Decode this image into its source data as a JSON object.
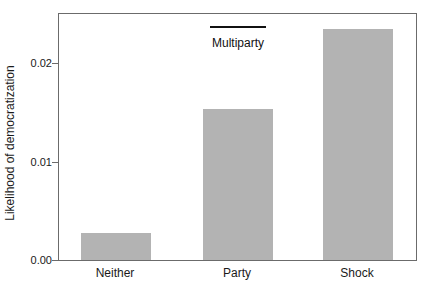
{
  "chart_data": {
    "type": "bar",
    "title": "",
    "xlabel": "",
    "ylabel": "Likelihood of democratization",
    "categories": [
      "Neither",
      "Party",
      "Shock"
    ],
    "values": [
      0.0027,
      0.0153,
      0.0235
    ],
    "ylim": [
      0,
      0.025
    ],
    "yticks": [
      {
        "label": "0.00",
        "value": 0
      },
      {
        "label": "0.01",
        "value": 0.01
      },
      {
        "label": "0.02",
        "value": 0.02
      }
    ],
    "grid": "off",
    "legend": "none",
    "annotation": {
      "text": "Multiparty",
      "over_category": "Party",
      "line_color": "#111111"
    },
    "colors": {
      "bar_fill": "#b3b3b3",
      "axis_box": "#6b6b6b",
      "text": "#1a1a1a",
      "background": "#ffffff"
    }
  }
}
